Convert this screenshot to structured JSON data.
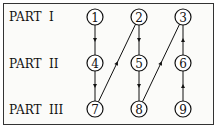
{
  "rows": [
    {
      "label": "PART  I"
    },
    {
      "label": "PART  II"
    },
    {
      "label": "PART  III"
    }
  ],
  "nodes": [
    {
      "id": "1",
      "row": 0,
      "col": 0
    },
    {
      "id": "2",
      "row": 0,
      "col": 1
    },
    {
      "id": "3",
      "row": 0,
      "col": 2
    },
    {
      "id": "4",
      "row": 1,
      "col": 0
    },
    {
      "id": "5",
      "row": 1,
      "col": 1
    },
    {
      "id": "6",
      "row": 1,
      "col": 2
    },
    {
      "id": "7",
      "row": 2,
      "col": 0
    },
    {
      "id": "8",
      "row": 2,
      "col": 1
    },
    {
      "id": "9",
      "row": 2,
      "col": 2
    }
  ],
  "edges": [
    {
      "from": "1",
      "to": "4"
    },
    {
      "from": "4",
      "to": "7"
    },
    {
      "from": "7",
      "to": "2"
    },
    {
      "from": "2",
      "to": "5"
    },
    {
      "from": "5",
      "to": "8"
    },
    {
      "from": "8",
      "to": "3"
    },
    {
      "from": "6",
      "to": "3"
    },
    {
      "from": "9",
      "to": "6"
    }
  ]
}
